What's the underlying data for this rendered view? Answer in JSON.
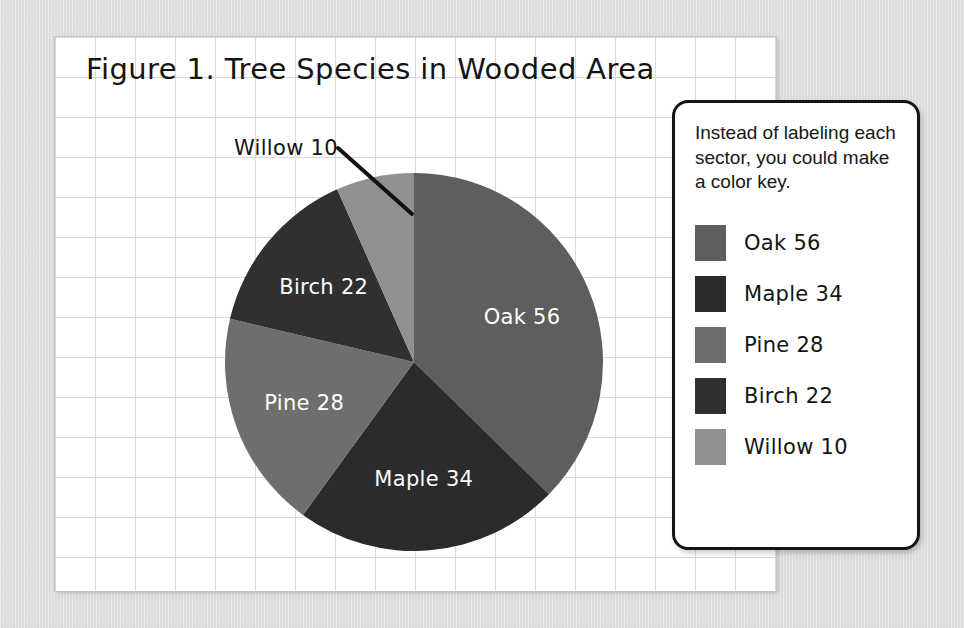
{
  "figure": {
    "title": "Figure 1. Tree Species in Wooded Area",
    "background_color": "#dcdcdc",
    "paper_color": "#ffffff",
    "grid_line_color": "#d9d9d9"
  },
  "callout": {
    "label": "Willow 10",
    "leader_line": "diagonal-leader-line"
  },
  "legend": {
    "note": "Instead of labeling each sector, you could make a color key.",
    "items": [
      {
        "label": "Oak 56",
        "color": "#5e5e5e"
      },
      {
        "label": "Maple 34",
        "color": "#2b2b2b"
      },
      {
        "label": "Pine 28",
        "color": "#6e6e6e"
      },
      {
        "label": "Birch 22",
        "color": "#303030"
      },
      {
        "label": "Willow 10",
        "color": "#909090"
      }
    ]
  },
  "chart_data": {
    "type": "pie",
    "title": "Figure 1. Tree Species in Wooded Area",
    "xlabel": "",
    "ylabel": "",
    "total": 150,
    "start_angle_deg": 0,
    "direction": "clockwise",
    "legend_position": "right",
    "grid": true,
    "categories": [
      "Oak",
      "Maple",
      "Pine",
      "Birch",
      "Willow"
    ],
    "values": [
      56,
      34,
      28,
      22,
      10
    ],
    "slice_labels": [
      "Oak 56",
      "Maple 34",
      "Pine 28",
      "Birch 22",
      "Willow 10"
    ],
    "colors": [
      "#5e5e5e",
      "#2b2b2b",
      "#6e6e6e",
      "#303030",
      "#909090"
    ],
    "percentages": [
      37.3,
      22.7,
      18.7,
      14.7,
      6.7
    ],
    "slices": [
      {
        "name": "Oak",
        "value": 56,
        "color": "#5e5e5e",
        "label": "Oak 56",
        "label_placement": "inside"
      },
      {
        "name": "Maple",
        "value": 34,
        "color": "#2b2b2b",
        "label": "Maple 34",
        "label_placement": "inside"
      },
      {
        "name": "Pine",
        "value": 28,
        "color": "#6e6e6e",
        "label": "Pine 28",
        "label_placement": "inside"
      },
      {
        "name": "Birch",
        "value": 22,
        "color": "#303030",
        "label": "Birch 22",
        "label_placement": "inside"
      },
      {
        "name": "Willow",
        "value": 10,
        "color": "#909090",
        "label": "Willow 10",
        "label_placement": "callout"
      }
    ],
    "annotations": [
      "Instead of labeling each sector, you could make a color key."
    ]
  }
}
